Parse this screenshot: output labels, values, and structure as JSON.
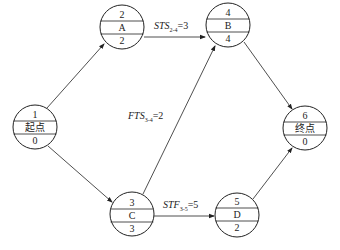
{
  "diagram": {
    "type": "precedence network (single-code network with lag relations)",
    "nodes": [
      {
        "id": "start",
        "top": "1",
        "name": "起点",
        "bottom": "0",
        "cx": 35,
        "cy": 127
      },
      {
        "id": "A",
        "top": "2",
        "name": "A",
        "bottom": "2",
        "cx": 122,
        "cy": 27
      },
      {
        "id": "B",
        "top": "4",
        "name": "B",
        "bottom": "4",
        "cx": 228,
        "cy": 25
      },
      {
        "id": "C",
        "top": "3",
        "name": "C",
        "bottom": "3",
        "cx": 132,
        "cy": 214
      },
      {
        "id": "D",
        "top": "5",
        "name": "D",
        "bottom": "2",
        "cx": 237,
        "cy": 215
      },
      {
        "id": "end",
        "top": "6",
        "name": "终点",
        "bottom": "0",
        "cx": 305,
        "cy": 128
      }
    ],
    "edges": [
      {
        "from": "start",
        "to": "A"
      },
      {
        "from": "start",
        "to": "C"
      },
      {
        "from": "A",
        "to": "B",
        "label": "STS"
      },
      {
        "from": "C",
        "to": "B",
        "label": "FTS"
      },
      {
        "from": "C",
        "to": "D",
        "label": "STF"
      },
      {
        "from": "B",
        "to": "end"
      },
      {
        "from": "D",
        "to": "end"
      }
    ],
    "labels": {
      "sts": {
        "name": "STS",
        "sub": "2-4",
        "value": "=3"
      },
      "fts": {
        "name": "FTS",
        "sub": "3-4",
        "value": "=2"
      },
      "stf": {
        "name": "STF",
        "sub": "3-5",
        "value": "=5"
      }
    }
  }
}
